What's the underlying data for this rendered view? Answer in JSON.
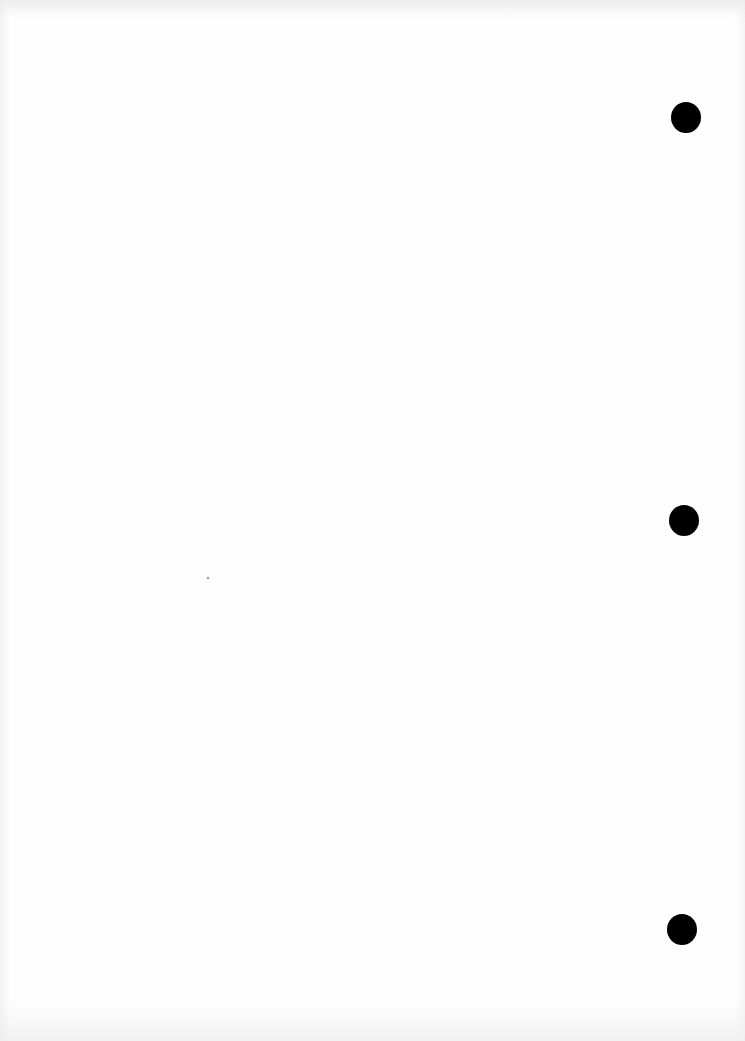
{
  "page": {
    "type": "blank scanned page",
    "background_color": "#fefefe",
    "punch_holes": [
      {
        "cx": 686,
        "cy": 117,
        "d": 30
      },
      {
        "cx": 684,
        "cy": 520,
        "d": 30
      },
      {
        "cx": 682,
        "cy": 929,
        "d": 30
      }
    ],
    "hole_color": "#000000"
  }
}
